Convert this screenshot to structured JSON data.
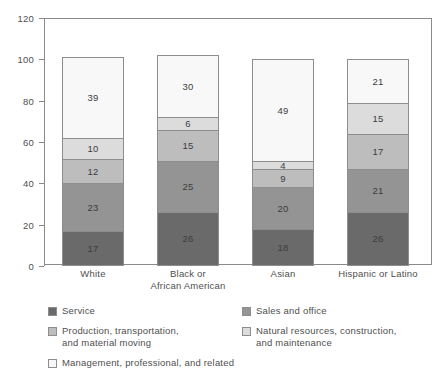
{
  "chart_data": {
    "type": "bar",
    "subtype": "stacked-vertical",
    "title": "",
    "xlabel": "",
    "ylabel": "",
    "ylim": [
      0,
      120
    ],
    "yticks": [
      0,
      20,
      40,
      60,
      80,
      100,
      120
    ],
    "grid": false,
    "legend_position": "bottom",
    "categories": [
      "White",
      "Black or\nAfrican American",
      "Asian",
      "Hispanic or Latino"
    ],
    "series": [
      {
        "name": "Service",
        "color": "#6a6a6a",
        "values": [
          17,
          26,
          18,
          26
        ]
      },
      {
        "name": "Sales and office",
        "color": "#949494",
        "values": [
          23,
          25,
          20,
          21
        ]
      },
      {
        "name": "Production, transportation,\nand material moving",
        "color": "#bdbdbd",
        "values": [
          12,
          15,
          9,
          17
        ]
      },
      {
        "name": "Natural resources, construction,\nand maintenance",
        "color": "#dcdcdc",
        "values": [
          10,
          6,
          4,
          15
        ]
      },
      {
        "name": "Management, professional, and related",
        "color": "#f8f8f8",
        "values": [
          39,
          30,
          49,
          21
        ]
      }
    ],
    "totals": [
      101,
      102,
      100,
      100
    ]
  },
  "axis": {
    "y_tick_labels": [
      "0",
      "20",
      "40",
      "60",
      "80",
      "100",
      "120"
    ]
  },
  "legend": {
    "left_column": [
      {
        "label": "Service",
        "color": "#6a6a6a"
      },
      {
        "label": "Production, transportation,\nand material moving",
        "color": "#bdbdbd"
      },
      {
        "label": "Management, professional, and related",
        "color": "#f8f8f8"
      }
    ],
    "right_column": [
      {
        "label": "Sales and office",
        "color": "#949494"
      },
      {
        "label": "Natural resources, construction,\nand maintenance",
        "color": "#dcdcdc"
      }
    ]
  }
}
